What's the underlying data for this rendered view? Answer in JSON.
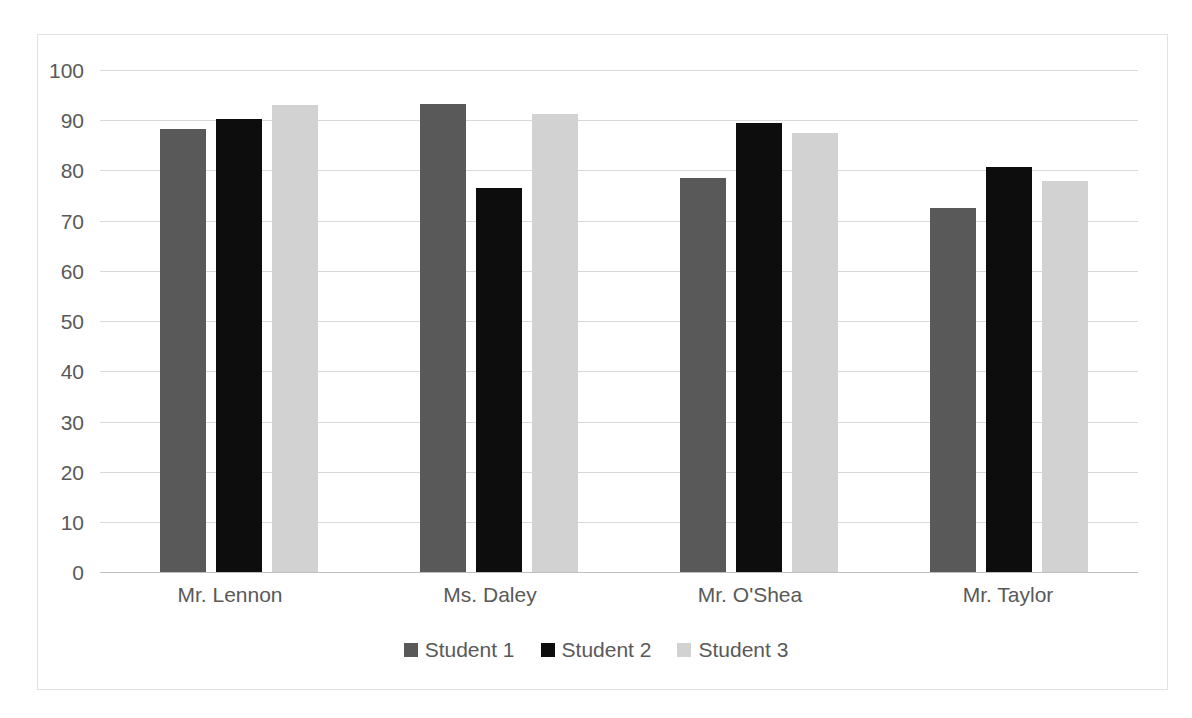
{
  "chart_data": {
    "type": "bar",
    "title": "",
    "subtitle": "",
    "xlabel": "",
    "ylabel": "",
    "ylim": [
      0,
      100
    ],
    "yticks": [
      100,
      90,
      80,
      70,
      60,
      50,
      40,
      30,
      20,
      10,
      0
    ],
    "grid": true,
    "legend_position": "bottom",
    "categories": [
      "Mr. Lennon",
      "Ms. Daley",
      "Mr. O'Shea",
      "Mr. Taylor"
    ],
    "series": [
      {
        "name": "Student 1",
        "color": "#595959",
        "values": [
          88.2,
          93.3,
          78.5,
          72.6
        ]
      },
      {
        "name": "Student 2",
        "color": "#0d0d0d",
        "values": [
          90.2,
          76.4,
          89.5,
          80.6
        ]
      },
      {
        "name": "Student 3",
        "color": "#d2d2d2",
        "values": [
          93.0,
          91.2,
          87.5,
          77.9
        ]
      }
    ]
  },
  "colors": {
    "gridline": "#d9d9d9",
    "axis": "#bfbfbf",
    "text": "#595959",
    "frame": "#e3e3e3",
    "background": "#ffffff"
  },
  "yticks": {
    "t0": "100",
    "t1": "90",
    "t2": "80",
    "t3": "70",
    "t4": "60",
    "t5": "50",
    "t6": "40",
    "t7": "30",
    "t8": "20",
    "t9": "10",
    "t10": "0"
  },
  "categories": {
    "c0": "Mr. Lennon",
    "c1": "Ms. Daley",
    "c2": "Mr. O'Shea",
    "c3": "Mr. Taylor"
  },
  "legend": {
    "items": [
      {
        "label": "Student 1"
      },
      {
        "label": "Student 2"
      },
      {
        "label": "Student 3"
      }
    ]
  }
}
